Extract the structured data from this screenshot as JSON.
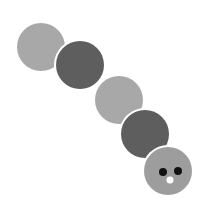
{
  "canvas": {
    "width": 210,
    "height": 209,
    "background": "#ffffff",
    "title": "caterpillar-figure"
  },
  "palette": {
    "light_gray": "#a8a8a8",
    "dark_gray": "#5e5e5e",
    "head_gray": "#9d9d9d",
    "eye_black": "#111111",
    "nose_white": "#ffffff",
    "separator_white": "#ffffff"
  },
  "figure": {
    "name": "caterpillar",
    "segment_count": 5,
    "chain_direction": "top-left to bottom-right",
    "separator_stroke_width": 4,
    "segments": [
      {
        "index": 0,
        "role": "tail-segment",
        "shape": "circle",
        "cx": 41,
        "cy": 47,
        "r": 24,
        "fill": "#a8a8a8",
        "tone": "light"
      },
      {
        "index": 1,
        "role": "body-segment",
        "shape": "circle",
        "cx": 80,
        "cy": 65,
        "r": 24,
        "fill": "#5e5e5e",
        "tone": "dark"
      },
      {
        "index": 2,
        "role": "body-segment",
        "shape": "circle",
        "cx": 119,
        "cy": 100,
        "r": 24,
        "fill": "#a8a8a8",
        "tone": "light"
      },
      {
        "index": 3,
        "role": "body-segment",
        "shape": "circle",
        "cx": 145,
        "cy": 134,
        "r": 24,
        "fill": "#5e5e5e",
        "tone": "dark"
      },
      {
        "index": 4,
        "role": "head-segment",
        "shape": "circle",
        "cx": 168,
        "cy": 171,
        "r": 24,
        "fill": "#9d9d9d",
        "tone": "medium"
      }
    ],
    "face": {
      "left_eye": {
        "cx": 163,
        "cy": 172,
        "r": 4,
        "fill": "#111111"
      },
      "right_eye": {
        "cx": 178,
        "cy": 171,
        "r": 4,
        "fill": "#111111"
      },
      "nose": {
        "cx": 170,
        "cy": 180,
        "r": 3.5,
        "fill": "#ffffff"
      }
    }
  }
}
